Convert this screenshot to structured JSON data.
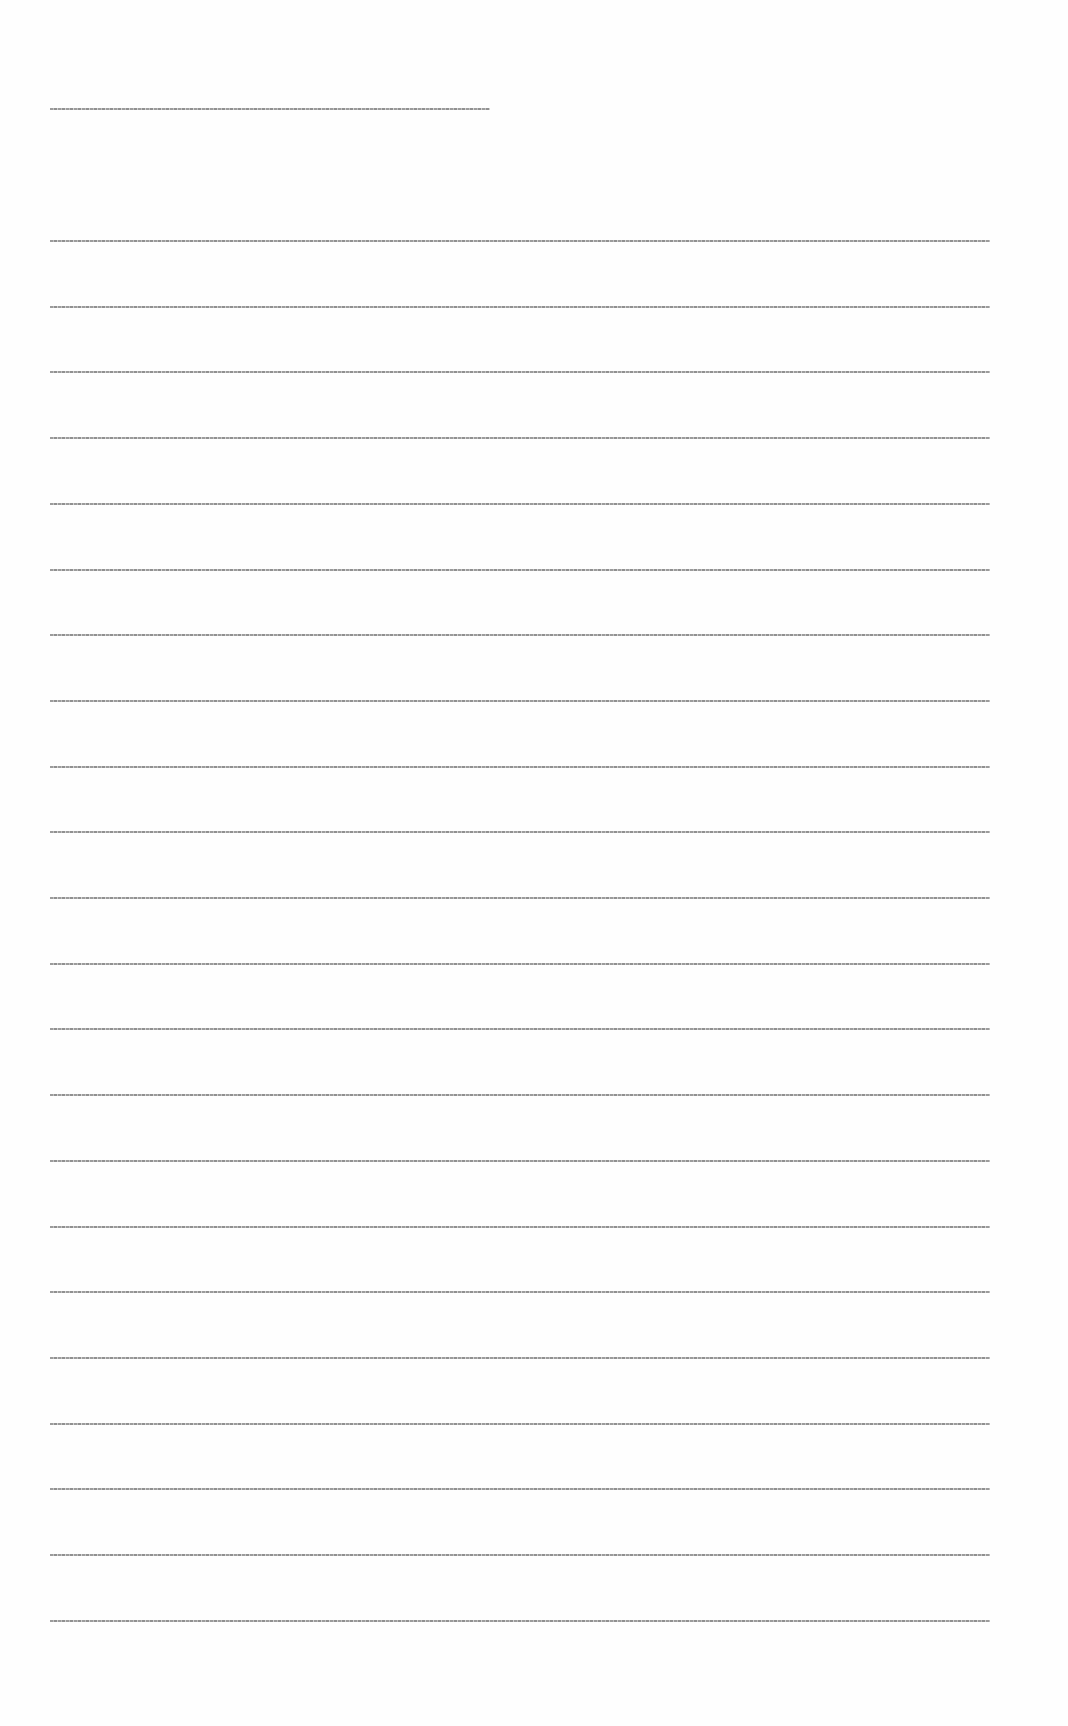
{
  "document": {
    "legible": false,
    "header": {
      "top_px": 108,
      "text": null
    },
    "body": {
      "line_count": 22,
      "first_top_px": 240,
      "line_pitch_px": 65.7,
      "lines": [
        {
          "index": 1,
          "text": null
        },
        {
          "index": 2,
          "text": null
        },
        {
          "index": 3,
          "text": null
        },
        {
          "index": 4,
          "text": null
        },
        {
          "index": 5,
          "text": null
        },
        {
          "index": 6,
          "text": null
        },
        {
          "index": 7,
          "text": null
        },
        {
          "index": 8,
          "text": null
        },
        {
          "index": 9,
          "text": null
        },
        {
          "index": 10,
          "text": null
        },
        {
          "index": 11,
          "text": null
        },
        {
          "index": 12,
          "text": null
        },
        {
          "index": 13,
          "text": null
        },
        {
          "index": 14,
          "text": null
        },
        {
          "index": 15,
          "text": null
        },
        {
          "index": 16,
          "text": null
        },
        {
          "index": 17,
          "text": null
        },
        {
          "index": 18,
          "text": null
        },
        {
          "index": 19,
          "text": null
        },
        {
          "index": 20,
          "text": null
        },
        {
          "index": 21,
          "text": null
        },
        {
          "index": 22,
          "text": null
        }
      ]
    }
  }
}
